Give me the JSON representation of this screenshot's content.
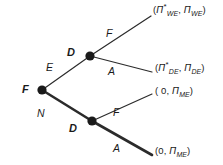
{
  "figure": {
    "type": "game-tree",
    "background_color": "#ffffff",
    "line_color": "#2b2b2b",
    "node_color": "#1a1a1a"
  },
  "nodes": [
    {
      "id": "root",
      "label": "F",
      "x": 42,
      "y": 90,
      "label_x": 22,
      "label_y": 84
    },
    {
      "id": "upper_d",
      "label": "D",
      "x": 90,
      "y": 56,
      "label_x": 67,
      "label_y": 47
    },
    {
      "id": "lower_d",
      "label": "D",
      "x": 92,
      "y": 121,
      "label_x": 69,
      "label_y": 123
    }
  ],
  "branches": [
    {
      "id": "root-E",
      "label": "E",
      "from": "root",
      "bold": false,
      "label_x": 46,
      "label_y": 62
    },
    {
      "id": "root-N",
      "label": "N",
      "from": "root",
      "bold": true,
      "label_x": 37,
      "label_y": 108
    },
    {
      "id": "upper-D-F",
      "label": "F",
      "from": "upper_d",
      "bold": false,
      "label_x": 106,
      "label_y": 28
    },
    {
      "id": "upper-D-A",
      "label": "A",
      "from": "upper_d",
      "bold": false,
      "label_x": 108,
      "label_y": 66
    },
    {
      "id": "lower-D-F",
      "label": "F",
      "from": "lower_d",
      "bold": false,
      "label_x": 113,
      "label_y": 107
    },
    {
      "id": "lower-D-A",
      "label": "A",
      "from": "lower_d",
      "bold": true,
      "label_x": 113,
      "label_y": 143
    }
  ],
  "payoffs": [
    {
      "id": "payoff-we",
      "text": "(Π*WE, ΠWE)",
      "open_paren": "(",
      "first_symbol": "Π",
      "first_star": "*",
      "first_sub": "WE",
      "separator": ", ",
      "second_symbol": "Π",
      "second_sub": "WE",
      "close_paren": ")",
      "x": 153,
      "y": 5
    },
    {
      "id": "payoff-de",
      "text": "(Π*DE, ΠDE)",
      "open_paren": "(",
      "first_symbol": "Π",
      "first_star": "*",
      "first_sub": "DE",
      "separator": ", ",
      "second_symbol": "Π",
      "second_sub": "DE",
      "close_paren": ")",
      "x": 155,
      "y": 63
    },
    {
      "id": "payoff-me-upper",
      "text": "( 0, ΠME)",
      "open_paren": "( ",
      "first_symbol": "0",
      "first_star": "",
      "first_sub": "",
      "separator": ", ",
      "second_symbol": "Π",
      "second_sub": "ME",
      "close_paren": ")",
      "x": 155,
      "y": 86
    },
    {
      "id": "payoff-me-lower",
      "text": "(0, ΠME)",
      "open_paren": "(",
      "first_symbol": "0",
      "first_star": "",
      "first_sub": "",
      "separator": ", ",
      "second_symbol": "Π",
      "second_sub": "ME",
      "close_paren": ")",
      "x": 155,
      "y": 146
    }
  ],
  "edges": {
    "root_to_upper_d": {
      "x1": 42,
      "y1": 90,
      "x2": 90,
      "y2": 56,
      "width": 1.2
    },
    "root_to_lower_d": {
      "x1": 42,
      "y1": 90,
      "x2": 92,
      "y2": 121,
      "width": 2.6
    },
    "upper_d_to_we": {
      "x1": 90,
      "y1": 56,
      "x2": 151,
      "y2": 16,
      "width": 1.2
    },
    "upper_d_to_de": {
      "x1": 90,
      "y1": 56,
      "x2": 152,
      "y2": 72,
      "width": 1.2
    },
    "lower_d_to_me1": {
      "x1": 92,
      "y1": 121,
      "x2": 152,
      "y2": 94,
      "width": 1.2
    },
    "lower_d_to_me2": {
      "x1": 92,
      "y1": 121,
      "x2": 152,
      "y2": 155,
      "width": 2.6
    }
  }
}
